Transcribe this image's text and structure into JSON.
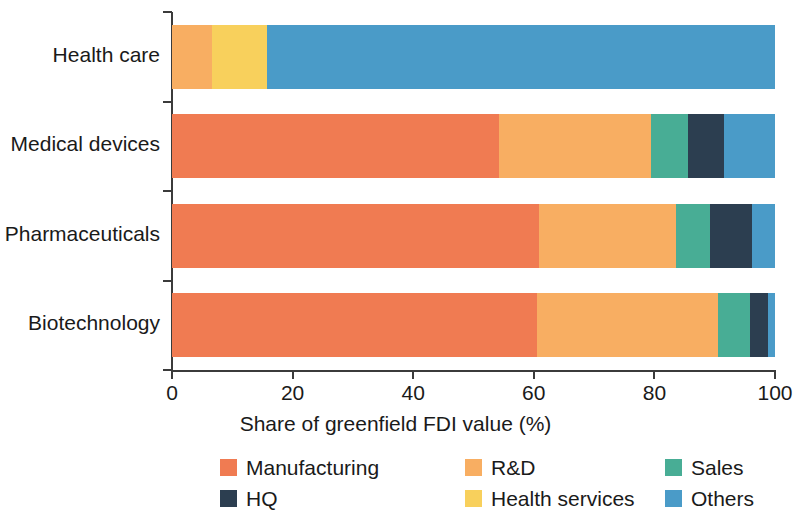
{
  "chart_data": {
    "type": "bar",
    "subtype": "horizontal-stacked-100",
    "title": "",
    "xlabel": "Share of greenfield FDI value (%)",
    "ylabel": "",
    "xlim": [
      0,
      100
    ],
    "xticks": [
      0,
      20,
      40,
      60,
      80,
      100
    ],
    "xtick_labels": [
      "0",
      "20",
      "40",
      "60",
      "80",
      "100"
    ],
    "grid": false,
    "legend_position": "bottom",
    "categories": [
      "Health care",
      "Medical devices",
      "Pharmaceuticals",
      "Biotechnology"
    ],
    "series": [
      {
        "name": "Manufacturing",
        "color": "#F07B52",
        "values": [
          0,
          54.2,
          60.9,
          60.5
        ]
      },
      {
        "name": "R&D",
        "color": "#F8AE62",
        "values": [
          6.6,
          25.2,
          22.7,
          30.0
        ]
      },
      {
        "name": "Sales",
        "color": "#48AD95",
        "values": [
          0,
          6.1,
          5.6,
          5.3
        ]
      },
      {
        "name": "HQ",
        "color": "#2C3E50",
        "values": [
          0,
          6.0,
          7.0,
          3.0
        ]
      },
      {
        "name": "Health services",
        "color": "#F8D05C",
        "values": [
          9.1,
          0,
          0,
          0
        ]
      },
      {
        "name": "Others",
        "color": "#4A9BC8",
        "values": [
          84.3,
          8.5,
          3.8,
          1.2
        ]
      }
    ],
    "stack_order": [
      "Manufacturing",
      "R&D",
      "Sales",
      "HQ",
      "Health services",
      "Others"
    ],
    "stacks": [
      {
        "category": "Health care",
        "segments": [
          {
            "name": "R&D",
            "value": 6.6,
            "color": "#F8AE62"
          },
          {
            "name": "Health services",
            "value": 9.1,
            "color": "#F8D05C"
          },
          {
            "name": "Others",
            "value": 84.3,
            "color": "#4A9BC8"
          }
        ]
      },
      {
        "category": "Medical devices",
        "segments": [
          {
            "name": "Manufacturing",
            "value": 54.2,
            "color": "#F07B52"
          },
          {
            "name": "R&D",
            "value": 25.2,
            "color": "#F8AE62"
          },
          {
            "name": "Sales",
            "value": 6.1,
            "color": "#48AD95"
          },
          {
            "name": "HQ",
            "value": 6.0,
            "color": "#2C3E50"
          },
          {
            "name": "Others",
            "value": 8.5,
            "color": "#4A9BC8"
          }
        ]
      },
      {
        "category": "Pharmaceuticals",
        "segments": [
          {
            "name": "Manufacturing",
            "value": 60.9,
            "color": "#F07B52"
          },
          {
            "name": "R&D",
            "value": 22.7,
            "color": "#F8AE62"
          },
          {
            "name": "Sales",
            "value": 5.6,
            "color": "#48AD95"
          },
          {
            "name": "HQ",
            "value": 7.0,
            "color": "#2C3E50"
          },
          {
            "name": "Others",
            "value": 3.8,
            "color": "#4A9BC8"
          }
        ]
      },
      {
        "category": "Biotechnology",
        "segments": [
          {
            "name": "Manufacturing",
            "value": 60.5,
            "color": "#F07B52"
          },
          {
            "name": "R&D",
            "value": 30.0,
            "color": "#F8AE62"
          },
          {
            "name": "Sales",
            "value": 5.3,
            "color": "#48AD95"
          },
          {
            "name": "HQ",
            "value": 3.0,
            "color": "#2C3E50"
          },
          {
            "name": "Others",
            "value": 1.2,
            "color": "#4A9BC8"
          }
        ]
      }
    ],
    "legend": [
      {
        "label": "Manufacturing",
        "color": "#F07B52"
      },
      {
        "label": "R&D",
        "color": "#F8AE62"
      },
      {
        "label": "Sales",
        "color": "#48AD95"
      },
      {
        "label": "HQ",
        "color": "#2C3E50"
      },
      {
        "label": "Health services",
        "color": "#F8D05C"
      },
      {
        "label": "Others",
        "color": "#4A9BC8"
      }
    ],
    "axis_color": "#3B3B3B",
    "background_color": "#FFFFFF"
  }
}
